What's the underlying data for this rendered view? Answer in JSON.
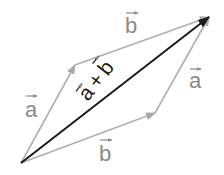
{
  "diagram": {
    "colors": {
      "component": "#a8a8a8",
      "resultant": "#1a1a1a",
      "label": "#8a8a8a",
      "background": "#ffffff"
    },
    "points": {
      "origin": [
        21,
        163
      ],
      "a_end": [
        75,
        65
      ],
      "b_end": [
        155,
        113
      ],
      "sum_end": [
        209,
        17
      ]
    },
    "labels": {
      "a_left": "a",
      "b_top": "b",
      "a_right": "a",
      "b_bottom": "b",
      "sum_a": "a",
      "sum_plus": "+",
      "sum_b": "b"
    }
  }
}
